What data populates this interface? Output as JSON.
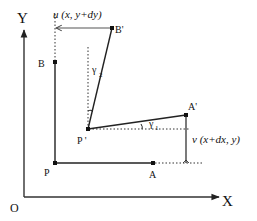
{
  "diagram": {
    "title": "",
    "axes": {
      "x_label": "X",
      "y_label": "Y",
      "origin_label": "O"
    },
    "points": {
      "P": "P",
      "A": "A",
      "B": "B",
      "P_prime": "P '",
      "A_prime": "A'",
      "B_prime": "B'"
    },
    "annotations": {
      "u_displacement": "u (x, y+dy)",
      "v_displacement": "v (x+dx, y)",
      "gamma_1_symbol": "γ",
      "gamma_1_sub": "1",
      "gamma_2_symbol": "γ",
      "gamma_2_sub": "2"
    },
    "colors": {
      "line": "#222222",
      "arrow_gray": "#555555",
      "background": "#ffffff"
    }
  }
}
